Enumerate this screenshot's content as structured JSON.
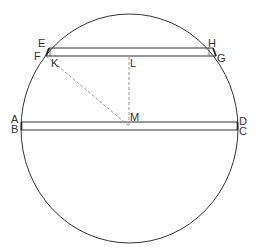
{
  "diagram": {
    "type": "geometry-circle-chords",
    "colors": {
      "stroke": "#333333",
      "dashed": "#888888",
      "background": "#ffffff"
    },
    "circle": {
      "cx": 129.5,
      "cy": 128.5,
      "rx": 108.5,
      "ry": 114.5
    },
    "labels": {
      "A": "A",
      "B": "B",
      "C": "C",
      "D": "D",
      "E": "E",
      "F": "F",
      "G": "G",
      "H": "H",
      "K": "K",
      "L": "L",
      "M": "M"
    },
    "rectangles": [
      {
        "name": "EHGF",
        "top": 48,
        "bottom": 56,
        "left_top": 49,
        "right_top": 213,
        "left_bottom": 46,
        "right_bottom": 216
      },
      {
        "name": "ADCB",
        "top": 122,
        "bottom": 130,
        "left": 21,
        "right": 238
      }
    ],
    "dashed_lines": [
      {
        "from": "L",
        "to": "M"
      },
      {
        "from": "F",
        "to": "M"
      }
    ],
    "points": {
      "M": [
        129,
        126
      ],
      "L": [
        129,
        57
      ],
      "K": [
        49,
        56
      ]
    }
  }
}
